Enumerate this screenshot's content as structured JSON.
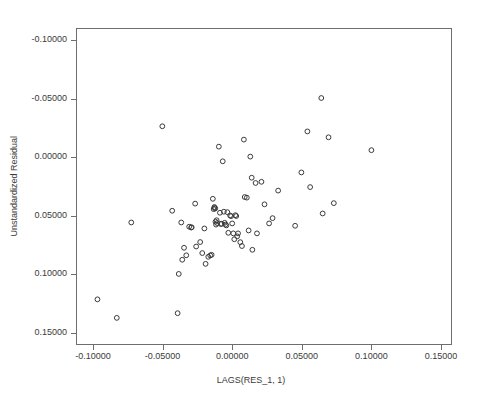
{
  "chart_data": {
    "type": "scatter",
    "title": "",
    "xlabel": "LAGS(RES_1, 1)",
    "ylabel": "Unstandardized Residual",
    "xlim": [
      -0.12069,
      0.15862
    ],
    "ylim": [
      -0.11046,
      0.16046
    ],
    "grid": false,
    "legend": "none",
    "marker": "open-circle",
    "marker_color": "#3a3a3a",
    "xticks": [
      -0.1,
      -0.05,
      0.0,
      0.05,
      0.1,
      0.15
    ],
    "yticks": [
      -0.1,
      -0.05,
      0.0,
      0.05,
      0.1,
      0.15
    ],
    "xtick_labels": [
      "-0.10000",
      "-0.05000",
      "0.00000",
      "0.05000",
      "0.10000",
      "0.15000"
    ],
    "ytick_labels": [
      "0.15000",
      "0.10000",
      "0.05000",
      "0.00000",
      "-0.05000",
      "-0.10000"
    ],
    "n_points": 77,
    "points": [
      [
        -0.0968,
        -0.0713
      ],
      [
        -0.0829,
        -0.0871
      ],
      [
        -0.0725,
        -0.0057
      ],
      [
        -0.0502,
        0.0764
      ],
      [
        -0.0431,
        0.0043
      ],
      [
        -0.0392,
        -0.0831
      ],
      [
        -0.0384,
        -0.0496
      ],
      [
        -0.0366,
        -0.0057
      ],
      [
        -0.0359,
        -0.0375
      ],
      [
        -0.0346,
        -0.0273
      ],
      [
        -0.033,
        -0.0337
      ],
      [
        -0.0309,
        -0.0093
      ],
      [
        -0.0295,
        -0.01
      ],
      [
        -0.0291,
        -0.0098
      ],
      [
        -0.0266,
        0.0104
      ],
      [
        -0.0259,
        -0.0262
      ],
      [
        -0.023,
        -0.0224
      ],
      [
        -0.0215,
        -0.0318
      ],
      [
        -0.02,
        -0.0108
      ],
      [
        -0.0191,
        -0.041
      ],
      [
        -0.0172,
        -0.035
      ],
      [
        -0.0158,
        -0.0338
      ],
      [
        -0.0148,
        -0.0333
      ],
      [
        -0.0139,
        0.0145
      ],
      [
        -0.0133,
        0.0057
      ],
      [
        -0.0128,
        0.0075
      ],
      [
        -0.0126,
        0.0068
      ],
      [
        -0.0122,
        0.0063
      ],
      [
        -0.012,
        -0.005
      ],
      [
        -0.0116,
        -0.0075
      ],
      [
        -0.0112,
        -0.0038
      ],
      [
        -0.0108,
        -0.0062
      ],
      [
        -0.0096,
        0.059
      ],
      [
        -0.0088,
        0.0026
      ],
      [
        -0.0082,
        -0.007
      ],
      [
        -0.0076,
        -0.0068
      ],
      [
        -0.0068,
        0.0465
      ],
      [
        -0.006,
        0.0035
      ],
      [
        -0.0054,
        -0.006
      ],
      [
        -0.0048,
        -0.0075
      ],
      [
        -0.0042,
        -0.0082
      ],
      [
        -0.0035,
        0.0031
      ],
      [
        -0.0028,
        -0.0145
      ],
      [
        -0.0015,
        0.0003
      ],
      [
        -0.0008,
        -0.0003
      ],
      [
        0.0,
        -0.0065
      ],
      [
        0.0008,
        -0.015
      ],
      [
        0.0015,
        -0.02
      ],
      [
        0.0022,
        0.0005
      ],
      [
        0.0029,
        -0.0002
      ],
      [
        0.0036,
        -0.0175
      ],
      [
        0.0042,
        -0.015
      ],
      [
        0.0058,
        -0.0225
      ],
      [
        0.007,
        -0.0258
      ],
      [
        0.0084,
        0.065
      ],
      [
        0.009,
        0.016
      ],
      [
        0.0105,
        0.0155
      ],
      [
        0.0118,
        -0.0125
      ],
      [
        0.013,
        0.0505
      ],
      [
        0.014,
        0.0325
      ],
      [
        0.0145,
        -0.029
      ],
      [
        0.0168,
        0.028
      ],
      [
        0.0178,
        -0.015
      ],
      [
        0.021,
        0.029
      ],
      [
        0.0232,
        0.0098
      ],
      [
        0.0265,
        -0.0065
      ],
      [
        0.029,
        -0.002
      ],
      [
        0.033,
        0.0215
      ],
      [
        0.0452,
        -0.0085
      ],
      [
        0.0497,
        0.037
      ],
      [
        0.054,
        0.072
      ],
      [
        0.056,
        0.0245
      ],
      [
        0.064,
        0.1005
      ],
      [
        0.065,
        0.002
      ],
      [
        0.0692,
        0.067
      ],
      [
        0.073,
        0.0108
      ],
      [
        0.1,
        0.056
      ]
    ]
  },
  "axes": {
    "x_title": "LAGS(RES_1, 1)",
    "y_title": "Unstandardized Residual"
  }
}
